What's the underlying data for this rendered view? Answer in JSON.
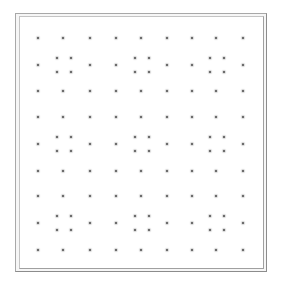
{
  "board": {
    "type": "dot-grid",
    "rows": 9,
    "cols": 9,
    "col_x": [
      38,
      63,
      90,
      116,
      141,
      167,
      192,
      216,
      243
    ],
    "row_y": [
      38,
      65,
      91,
      117,
      144,
      171,
      196,
      223,
      250
    ],
    "clusters": {
      "rows": [
        1,
        4,
        7
      ],
      "cols": [
        1,
        4,
        7
      ],
      "offset": 7,
      "size": "2x2"
    },
    "frame": {
      "outer": {
        "x": 15,
        "y": 13,
        "w": 252,
        "h": 259
      },
      "inner": {
        "x": 19,
        "y": 16,
        "w": 245,
        "h": 253
      }
    },
    "colors": {
      "background": "#ffffff",
      "dot": "#4a4a4a",
      "frame_outer": "#a8a8a8",
      "frame_inner": "#c4c4c4"
    }
  }
}
